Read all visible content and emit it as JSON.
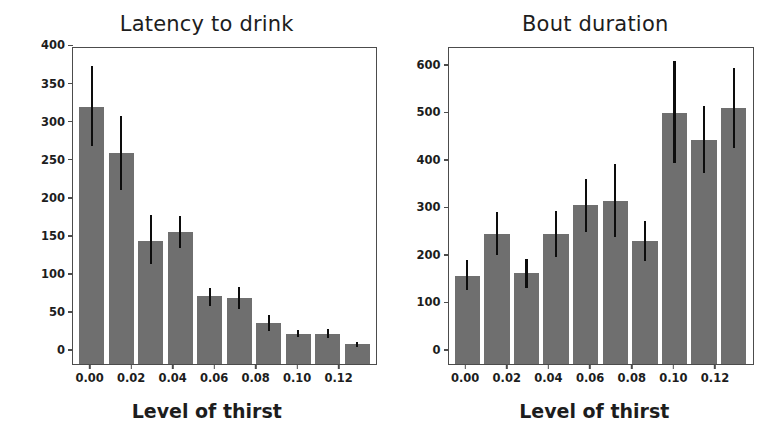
{
  "figure": {
    "background": "#ffffff",
    "bar_color": "#6f6f6f",
    "error_color": "#0d0d0d",
    "axis_color": "#4c4c4c"
  },
  "chart_data": [
    {
      "type": "bar",
      "title": "Latency to drink",
      "xlabel": "Level of thirst",
      "ylabel": "Mean time (a.u)",
      "grid": false,
      "legend": "none",
      "ylim": [
        0,
        415
      ],
      "xlim": [
        -0.008,
        0.138
      ],
      "yticks": [
        0,
        50,
        100,
        150,
        200,
        250,
        300,
        350,
        400
      ],
      "ytick_labels": [
        "0",
        "50",
        "100",
        "150",
        "200",
        "250",
        "300",
        "350",
        "400"
      ],
      "xticks": [
        0.0,
        0.02,
        0.04,
        0.06,
        0.08,
        0.1,
        0.12
      ],
      "xtick_labels": [
        "0.00",
        "0.02",
        "0.04",
        "0.06",
        "0.08",
        "0.10",
        "0.12"
      ],
      "x": [
        0.0,
        0.014,
        0.028,
        0.042,
        0.056,
        0.07,
        0.084,
        0.098,
        0.112,
        0.126
      ],
      "values": [
        338,
        277,
        162,
        174,
        89,
        87,
        54,
        40,
        39,
        26
      ],
      "error_low": [
        286,
        228,
        131,
        152,
        76,
        72,
        43,
        36,
        34,
        23
      ],
      "error_high": [
        392,
        326,
        196,
        195,
        100,
        101,
        64,
        45,
        46,
        29
      ]
    },
    {
      "type": "bar",
      "title": "Bout duration",
      "xlabel": "Level of thirst",
      "ylabel": "Mean time (a.u)",
      "grid": false,
      "legend": "none",
      "ylim": [
        0,
        665
      ],
      "xlim": [
        -0.008,
        0.138
      ],
      "yticks": [
        0,
        100,
        200,
        300,
        400,
        500,
        600
      ],
      "ytick_labels": [
        "0",
        "100",
        "200",
        "300",
        "400",
        "500",
        "600"
      ],
      "xticks": [
        0.0,
        0.02,
        0.04,
        0.06,
        0.08,
        0.1,
        0.12
      ],
      "xtick_labels": [
        "0.00",
        "0.02",
        "0.04",
        "0.06",
        "0.08",
        "0.10",
        "0.12"
      ],
      "x": [
        0.0,
        0.014,
        0.028,
        0.042,
        0.056,
        0.07,
        0.084,
        0.098,
        0.112,
        0.126
      ],
      "values": [
        186,
        274,
        191,
        273,
        334,
        344,
        258,
        528,
        472,
        539
      ],
      "error_low": [
        156,
        230,
        159,
        226,
        278,
        268,
        216,
        422,
        401,
        455
      ],
      "error_high": [
        218,
        319,
        221,
        321,
        390,
        421,
        300,
        637,
        542,
        623
      ]
    }
  ]
}
